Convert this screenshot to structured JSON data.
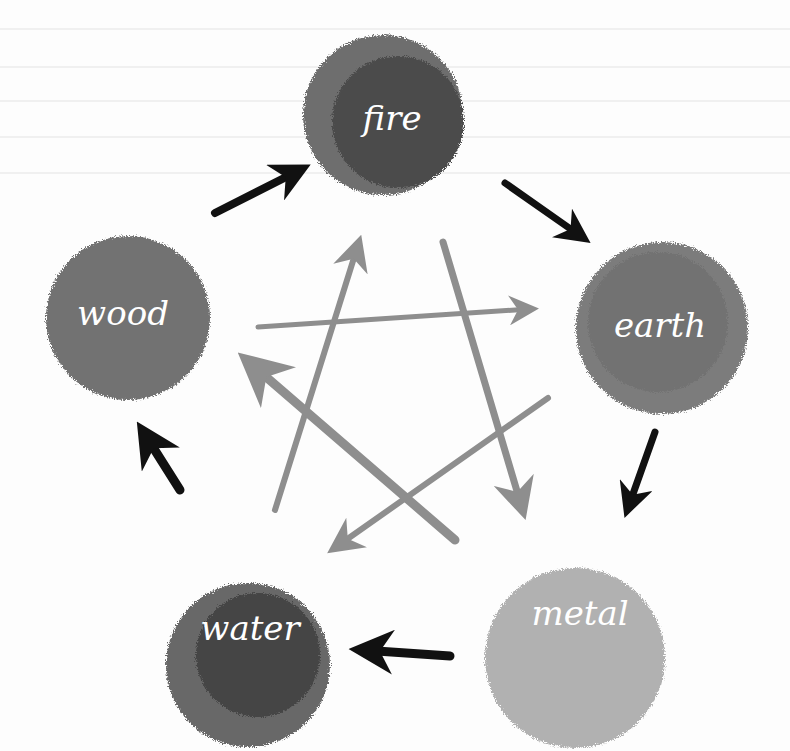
{
  "diagram": {
    "type": "wu-xing-five-elements-cycle",
    "nodes": [
      {
        "id": "fire",
        "label": "fire",
        "cx": 383,
        "cy": 115,
        "r": 80,
        "outer": "#6e6e6e",
        "inner": "#4c4c4c"
      },
      {
        "id": "earth",
        "label": "earth",
        "cx": 662,
        "cy": 328,
        "r": 86,
        "outer": "#7c7c7c",
        "inner": "#727272"
      },
      {
        "id": "metal",
        "label": "metal",
        "cx": 575,
        "cy": 658,
        "r": 90,
        "outer": "#b1b1b1",
        "inner": "#a8a8a8"
      },
      {
        "id": "water",
        "label": "water",
        "cx": 248,
        "cy": 665,
        "r": 82,
        "outer": "#676767",
        "inner": "#444444"
      },
      {
        "id": "wood",
        "label": "wood",
        "cx": 128,
        "cy": 318,
        "r": 82,
        "outer": "#727272",
        "inner": "#666666"
      }
    ],
    "generating_cycle": {
      "color": "#111111",
      "edges": [
        {
          "from": "wood",
          "to": "fire"
        },
        {
          "from": "fire",
          "to": "earth"
        },
        {
          "from": "earth",
          "to": "metal"
        },
        {
          "from": "metal",
          "to": "water"
        },
        {
          "from": "water",
          "to": "wood"
        }
      ]
    },
    "controlling_cycle": {
      "color": "#8e8e8e",
      "edges": [
        {
          "from": "water",
          "to": "fire"
        },
        {
          "from": "fire",
          "to": "metal"
        },
        {
          "from": "metal",
          "to": "wood"
        },
        {
          "from": "wood",
          "to": "earth"
        },
        {
          "from": "earth",
          "to": "water"
        }
      ]
    }
  }
}
